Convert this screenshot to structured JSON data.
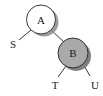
{
  "diagram": {
    "type": "binary-tree",
    "nodes": [
      {
        "id": "A",
        "label": "A",
        "style": "white"
      },
      {
        "id": "B",
        "label": "B",
        "style": "grey"
      }
    ],
    "leaves": [
      {
        "id": "S",
        "label": "S",
        "parent": "A"
      },
      {
        "id": "T",
        "label": "T",
        "parent": "B"
      },
      {
        "id": "U",
        "label": "U",
        "parent": "B"
      }
    ],
    "edges": [
      {
        "from": "A",
        "to": "S"
      },
      {
        "from": "A",
        "to": "B"
      },
      {
        "from": "B",
        "to": "T"
      },
      {
        "from": "B",
        "to": "U"
      }
    ],
    "colors": {
      "white_node_fill": "#ffffff",
      "grey_node_fill": "#a9a9a9",
      "shadow": "#8c8c8c",
      "stroke": "#222222"
    }
  }
}
